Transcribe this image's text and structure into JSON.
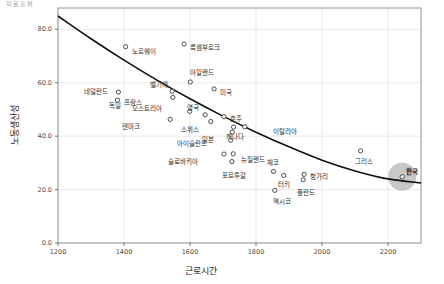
{
  "top_fragment": "자료출처",
  "axes": {
    "x_title": "근로시간",
    "y_title": "노동생산성",
    "x_ticks": [
      "1200",
      "1400",
      "1600",
      "1800",
      "2000",
      "2200"
    ],
    "y_ticks": [
      "0.0",
      "20.0",
      "40.0",
      "60.0",
      "80.0"
    ]
  },
  "chart_data": {
    "type": "scatter",
    "title": "",
    "xlabel": "근로시간",
    "ylabel": "노동생산성",
    "xlim": [
      1200,
      2300
    ],
    "ylim": [
      0,
      88
    ],
    "grid": true,
    "legend": false,
    "trendline": {
      "description": "fitted downward-curving trend line",
      "points": [
        [
          1200,
          85.0
        ],
        [
          1300,
          76.5
        ],
        [
          1400,
          68.5
        ],
        [
          1500,
          61.0
        ],
        [
          1600,
          54.0
        ],
        [
          1700,
          47.5
        ],
        [
          1800,
          41.5
        ],
        [
          1900,
          36.0
        ],
        [
          2000,
          31.0
        ],
        [
          2100,
          27.0
        ],
        [
          2200,
          24.0
        ],
        [
          2300,
          22.5
        ]
      ]
    },
    "points": [
      {
        "label": "노르웨이",
        "x": 1405,
        "y": 73.5,
        "label_dx": 6,
        "label_dy": 5,
        "highlight": false
      },
      {
        "label": "룩셈부르크",
        "x": 1582,
        "y": 74.5,
        "label_dx": 6,
        "label_dy": 4,
        "highlight": false
      },
      {
        "label": "아일랜드",
        "x": 1601,
        "y": 60.3,
        "label_dx": 0,
        "label_dy": -9,
        "highlight": false
      },
      {
        "label": "네덜란드",
        "x": 1383,
        "y": 56.5,
        "label_dx": -34,
        "label_dy": 0,
        "highlight": false
      },
      {
        "label": "벨기에",
        "x": 1546,
        "y": 56.8,
        "label_dx": -22,
        "label_dy": -6,
        "highlight": false
      },
      {
        "label": "미국",
        "x": 1673,
        "y": 57.7,
        "label_dx": 6,
        "label_dy": 4,
        "highlight": false
      },
      {
        "label": "프랑스",
        "x": 1380,
        "y": 53.5,
        "label_dx": 7,
        "label_dy": 3,
        "highlight": false
      },
      {
        "label": "독일",
        "x": 1548,
        "y": 54.5,
        "label_dx": -64,
        "label_dy": 9,
        "highlight": false
      },
      {
        "label": "영국",
        "x": 1646,
        "y": 48.0,
        "label_dx": -18,
        "label_dy": -7,
        "highlight": false
      },
      {
        "label": "오스트리아",
        "x": 1599,
        "y": 49.3,
        "label_dx": -58,
        "label_dy": -2,
        "highlight": false
      },
      {
        "label": "덴마크",
        "x": 1540,
        "y": 46.3,
        "label_dx": -48,
        "label_dy": 8,
        "highlight": false
      },
      {
        "label": "스위스",
        "x": 1663,
        "y": 45.5,
        "label_dx": -30,
        "label_dy": 9,
        "highlight": false
      },
      {
        "label": "호주",
        "x": 1703,
        "y": 47.3,
        "label_dx": 6,
        "label_dy": 2,
        "highlight": false
      },
      {
        "label": "이탈리아",
        "x": 1766,
        "y": 43.5,
        "label_dx": 28,
        "label_dy": 5,
        "highlight": false
      },
      {
        "label": "캐나다",
        "x": 1732,
        "y": 43.4,
        "label_dx": -8,
        "label_dy": 10,
        "highlight": false
      },
      {
        "label": "일본",
        "x": 1728,
        "y": 41.5,
        "label_dx": -30,
        "label_dy": 8,
        "highlight": false
      },
      {
        "label": "아이슬란드",
        "x": 1723,
        "y": 38.5,
        "label_dx": -54,
        "label_dy": 4,
        "highlight": false
      },
      {
        "label": "슬로바키아",
        "x": 1703,
        "y": 33.3,
        "label_dx": -56,
        "label_dy": 8,
        "highlight": false
      },
      {
        "label": "뉴질랜드",
        "x": 1731,
        "y": 33.4,
        "label_dx": 8,
        "label_dy": 6,
        "highlight": false
      },
      {
        "label": "포르투갈",
        "x": 1727,
        "y": 30.5,
        "label_dx": -10,
        "label_dy": 14,
        "highlight": false
      },
      {
        "label": "체코",
        "x": 1853,
        "y": 26.8,
        "label_dx": -6,
        "label_dy": -8,
        "highlight": false
      },
      {
        "label": "터키",
        "x": 1884,
        "y": 25.3,
        "label_dx": -6,
        "label_dy": 10,
        "highlight": false
      },
      {
        "label": "헝가리",
        "x": 1946,
        "y": 25.7,
        "label_dx": 6,
        "label_dy": 3,
        "highlight": false
      },
      {
        "label": "폴란드",
        "x": 1943,
        "y": 23.7,
        "label_dx": -6,
        "label_dy": 13,
        "highlight": false
      },
      {
        "label": "멕시코",
        "x": 1857,
        "y": 19.7,
        "label_dx": -2,
        "label_dy": 12,
        "highlight": false
      },
      {
        "label": "그리스",
        "x": 2117,
        "y": 34.5,
        "label_dx": -6,
        "label_dy": 11,
        "highlight": false
      },
      {
        "label": "한국",
        "x": 2243,
        "y": 24.8,
        "label_dx": 4,
        "label_dy": -5,
        "highlight": true
      }
    ]
  }
}
